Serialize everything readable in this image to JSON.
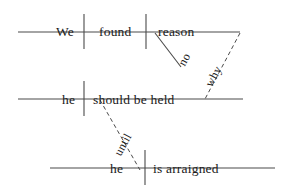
{
  "diagram": {
    "type": "reed-kellogg-sentence-diagram",
    "sentence": "We found no reason why he should be held until he is arraigned",
    "stroke_color": "#4a4a4a",
    "text_color": "#1a1a1a",
    "background_color": "#ffffff",
    "clauses": [
      {
        "id": "main-clause",
        "baseline_label": "main-clause-baseline",
        "subject": "We",
        "predicate": "found",
        "object": "reason",
        "modifier": "no"
      },
      {
        "id": "relative-clause",
        "baseline_label": "relative-clause-baseline",
        "subject": "he",
        "predicate": "should be held",
        "connector": "why"
      },
      {
        "id": "subordinate-clause",
        "baseline_label": "subordinate-clause-baseline",
        "subject": "he",
        "predicate": "is arraigned",
        "connector": "until"
      }
    ],
    "words": [
      {
        "name": "word-we",
        "text": "We",
        "x": 56,
        "y": 25,
        "rotate": 0,
        "size": 13.5
      },
      {
        "name": "word-found",
        "text": "found",
        "x": 99,
        "y": 25,
        "rotate": 0,
        "size": 13.5
      },
      {
        "name": "word-reason",
        "text": "reason",
        "x": 158,
        "y": 25,
        "rotate": 0,
        "size": 13.5
      },
      {
        "name": "word-no",
        "text": "no",
        "x": 176,
        "y": 62,
        "rotate": -62,
        "size": 12
      },
      {
        "name": "word-why",
        "text": "why",
        "x": 203,
        "y": 83,
        "rotate": -62,
        "size": 12
      },
      {
        "name": "word-he-1",
        "text": "he",
        "x": 62,
        "y": 93,
        "rotate": 0,
        "size": 13.5
      },
      {
        "name": "word-should-be-held",
        "text": "should be held",
        "x": 93,
        "y": 93,
        "rotate": 0,
        "size": 13.5
      },
      {
        "name": "word-until",
        "text": "until",
        "x": 112,
        "y": 152,
        "rotate": -62,
        "size": 12
      },
      {
        "name": "word-he-2",
        "text": "he",
        "x": 110,
        "y": 162,
        "rotate": 0,
        "size": 13.5
      },
      {
        "name": "word-is-arraigned",
        "text": "is arraigned",
        "x": 153,
        "y": 162,
        "rotate": 0,
        "size": 13.5
      }
    ],
    "baselines": [
      {
        "name": "main-clause-baseline",
        "x1": 18,
        "y1": 32,
        "x2": 240,
        "y2": 32
      },
      {
        "name": "relative-clause-baseline",
        "x1": 18,
        "y1": 99,
        "x2": 243,
        "y2": 99
      },
      {
        "name": "subordinate-clause-baseline",
        "x1": 50,
        "y1": 168,
        "x2": 275,
        "y2": 168
      }
    ],
    "dividers": [
      {
        "name": "subject-verb-divider-main",
        "x1": 84,
        "y1": 14,
        "x2": 84,
        "y2": 49
      },
      {
        "name": "verb-object-divider-main",
        "x1": 146,
        "y1": 14,
        "x2": 146,
        "y2": 49
      },
      {
        "name": "subject-verb-divider-relative",
        "x1": 84,
        "y1": 81,
        "x2": 84,
        "y2": 116
      },
      {
        "name": "subject-verb-divider-sub",
        "x1": 145,
        "y1": 150,
        "x2": 145,
        "y2": 185
      }
    ],
    "modifier_lines": [
      {
        "name": "modifier-slant-no",
        "x1": 155,
        "y1": 33,
        "x2": 181,
        "y2": 67,
        "dashed": false
      }
    ],
    "connector_lines": [
      {
        "name": "connector-dashed-why",
        "x1": 240,
        "y1": 33,
        "x2": 205,
        "y2": 99,
        "dashed": true
      },
      {
        "name": "connector-dashed-until",
        "x1": 100,
        "y1": 100,
        "x2": 140,
        "y2": 170,
        "dashed": true
      }
    ]
  }
}
